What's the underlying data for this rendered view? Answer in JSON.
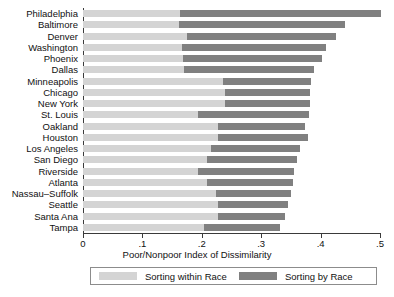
{
  "chart_data": {
    "type": "bar",
    "orientation": "horizontal",
    "stacked": true,
    "title": "",
    "xlabel": "Poor/Nonpoor Index of Dissimilarity",
    "ylabel": "",
    "xlim": [
      0,
      0.5
    ],
    "xticks": [
      "0",
      ".1",
      ".2",
      ".3",
      ".4",
      ".5"
    ],
    "xtick_values": [
      0,
      0.1,
      0.2,
      0.3,
      0.4,
      0.5
    ],
    "grid": false,
    "legend_position": "bottom",
    "categories": [
      "Philadelphia",
      "Baltimore",
      "Denver",
      "Washington",
      "Phoenix",
      "Dallas",
      "Minneapolis",
      "Chicago",
      "New York",
      "St. Louis",
      "Oakland",
      "Houston",
      "Los Angeles",
      "San Diego",
      "Riverside",
      "Atlanta",
      "Nassau–Suffolk",
      "Seattle",
      "Santa Ana",
      "Tampa"
    ],
    "series": [
      {
        "name": "Sorting within Race",
        "color": "#d4d4d4",
        "values": [
          0.163,
          0.162,
          0.175,
          0.167,
          0.168,
          0.17,
          0.235,
          0.239,
          0.239,
          0.194,
          0.227,
          0.227,
          0.216,
          0.208,
          0.193,
          0.208,
          0.224,
          0.227,
          0.227,
          0.204
        ]
      },
      {
        "name": "Sorting by Race",
        "color": "#808080",
        "values": [
          0.339,
          0.279,
          0.251,
          0.242,
          0.235,
          0.219,
          0.149,
          0.143,
          0.143,
          0.186,
          0.147,
          0.151,
          0.15,
          0.152,
          0.163,
          0.145,
          0.126,
          0.118,
          0.113,
          0.127
        ]
      }
    ],
    "totals": [
      0.502,
      0.441,
      0.426,
      0.409,
      0.403,
      0.389,
      0.384,
      0.382,
      0.382,
      0.38,
      0.374,
      0.378,
      0.366,
      0.36,
      0.356,
      0.353,
      0.35,
      0.345,
      0.34,
      0.331
    ]
  }
}
